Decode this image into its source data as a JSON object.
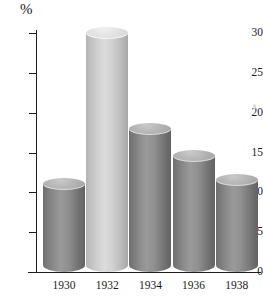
{
  "chart_data": {
    "type": "bar",
    "title": "",
    "subtitle": "",
    "xlabel": "",
    "ylabel": "%",
    "categories": [
      "1930",
      "1932",
      "1934",
      "1936",
      "1938"
    ],
    "values": [
      11,
      30,
      18,
      14.5,
      11.5
    ],
    "series": [
      {
        "name": "Percent",
        "values": [
          11,
          30,
          18,
          14.5,
          11.5
        ]
      }
    ],
    "ylim": [
      0,
      30
    ],
    "yticks": [
      0,
      5,
      10,
      15,
      20,
      25,
      30
    ],
    "ytick_labels": [
      "0",
      "5",
      "10",
      "15",
      "20",
      "25",
      "30"
    ],
    "grid": false,
    "legend": false,
    "legend_position": "none",
    "annotations": [],
    "bar_style": "3d-cylinder",
    "bar_colors": [
      "#8a8a8a",
      "#cfcfcf",
      "#8a8a8a",
      "#8a8a8a",
      "#8a8a8a"
    ],
    "highlighted_category": "1932",
    "axis_color": "#1d1d1d",
    "background_color": "#ffffff"
  }
}
